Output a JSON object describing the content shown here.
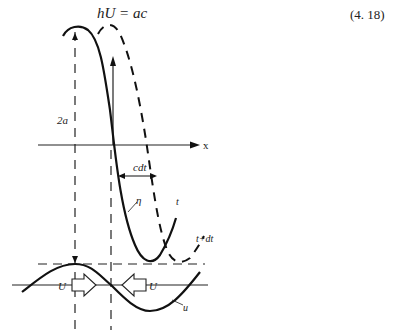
{
  "equation": {
    "text": "hU = ac",
    "number": "(4. 18)"
  },
  "diagram": {
    "labels": {
      "amplitude": "2a",
      "x_axis": "x",
      "displacement": "cdt",
      "eta": "η",
      "time_t": "t",
      "time_t_dt": "t+dt",
      "velocity_left": "U",
      "velocity_right": "U",
      "u_curve": "u"
    },
    "colors": {
      "stroke": "#111111",
      "background": "#ffffff"
    }
  }
}
